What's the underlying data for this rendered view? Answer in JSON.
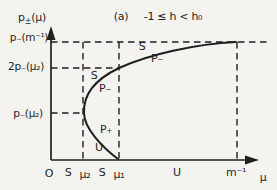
{
  "figure": {
    "title": {
      "index": "(a)",
      "condition": "-1 ≤ h < h₀"
    },
    "y_axis": {
      "label_p": "p",
      "label_sub": "±",
      "label_arg": "(μ)",
      "ticks": [
        "p₋(m⁻¹)",
        "2p₋(μ₂)",
        "p₋(μ₂)"
      ]
    },
    "x_axis": {
      "label": "μ",
      "ticks": [
        "O",
        "S",
        "μ₂",
        "S",
        "μ₁",
        "U",
        "m⁻¹"
      ]
    },
    "curve_labels": {
      "upper_s": "S",
      "upper_p_minus": "P₋",
      "mid_s": "S",
      "mid_p_minus": "P₋",
      "lower_p_plus": "P₊",
      "lower_u": "U"
    },
    "colors": {
      "ink": "#1f1f1f",
      "paper": "#f4f3ef"
    },
    "svg": [
      {
        "el": "line",
        "name": "y-axis-line",
        "x1": 51,
        "y1": 33,
        "x2": 51,
        "y2": 160,
        "class": "solid"
      },
      {
        "el": "line",
        "name": "x-axis-line",
        "x1": 51,
        "y1": 160,
        "x2": 250,
        "y2": 160,
        "class": "solid"
      },
      {
        "el": "polygon",
        "name": "y-axis-arrowhead",
        "points": "51,26 46.5,40 55.5,40",
        "class": "fill"
      },
      {
        "el": "polygon",
        "name": "x-axis-arrowhead",
        "points": "259,160 245,155.5 245,164.5",
        "class": "fill"
      },
      {
        "el": "line",
        "name": "p-minus-m-inv-dashed-line",
        "x1": 51,
        "y1": 42,
        "x2": 270,
        "y2": 42,
        "class": "dash"
      },
      {
        "el": "line",
        "name": "two-p-minus-mu2-dashed-line",
        "x1": 51,
        "y1": 68,
        "x2": 119,
        "y2": 68,
        "class": "dash"
      },
      {
        "el": "line",
        "name": "p-minus-mu2-dashed-line",
        "x1": 51,
        "y1": 113,
        "x2": 84,
        "y2": 113,
        "class": "dash"
      },
      {
        "el": "line",
        "name": "mu2-dashed-line",
        "x1": 83,
        "y1": 42,
        "x2": 83,
        "y2": 160,
        "class": "dash"
      },
      {
        "el": "line",
        "name": "mu1-dashed-line",
        "x1": 119,
        "y1": 42,
        "x2": 119,
        "y2": 160,
        "class": "dash"
      },
      {
        "el": "line",
        "name": "m-inv-dashed-line",
        "x1": 237,
        "y1": 42,
        "x2": 237,
        "y2": 160,
        "class": "dash"
      },
      {
        "el": "path",
        "name": "upper-branch-curve",
        "d": "M 84 113 C 83 94 96 79 119 68 C 150 54 196 44 236 42",
        "class": "curve"
      },
      {
        "el": "path",
        "name": "lower-branch-curve",
        "d": "M 84 113 C 84 128 102 147 118 159",
        "class": "curve"
      }
    ]
  },
  "chart_data": {
    "type": "line",
    "title": "(a) -1 ≤ h < h₀",
    "xlabel": "μ",
    "ylabel": "p±(μ)",
    "x_tick_labels": [
      "O",
      "S",
      "μ₂",
      "S",
      "μ₁",
      "U",
      "m⁻¹"
    ],
    "y_tick_labels": [
      "p₋(μ₂)",
      "2p₋(μ₂)",
      "p₋(m⁻¹)"
    ],
    "x_key_values_units_of_m_inv": {
      "μ₂": 0.18,
      "μ₁": 0.37,
      "m⁻¹": 1.0
    },
    "y_key_values_units_of_p_minus_m_inv": {
      "p₋(μ₂)": 0.4,
      "2p₋(μ₂)": 0.78,
      "p₋(m⁻¹)": 1.0
    },
    "xlim": [
      0,
      1.15
    ],
    "ylim": [
      0,
      1.1
    ],
    "grid": false,
    "series": [
      {
        "name": "P₋ upper branch (S)",
        "x": [
          0.18,
          0.22,
          0.28,
          0.37,
          0.53,
          0.75,
          1.0
        ],
        "y": [
          0.4,
          0.61,
          0.71,
          0.78,
          0.9,
          0.97,
          1.0
        ]
      },
      {
        "name": "P₊ lower branch (U)",
        "x": [
          0.18,
          0.24,
          0.31,
          0.36
        ],
        "y": [
          0.4,
          0.23,
          0.1,
          0.0
        ]
      }
    ],
    "guides": {
      "horizontal_dashed_levels": [
        "p₋(m⁻¹)",
        "2p₋(μ₂)",
        "p₋(μ₂)"
      ],
      "vertical_dashed_at": [
        "μ₂",
        "μ₁",
        "m⁻¹"
      ]
    },
    "annotations": [
      "S",
      "P₋",
      "S",
      "P₋",
      "P₊",
      "U"
    ]
  }
}
